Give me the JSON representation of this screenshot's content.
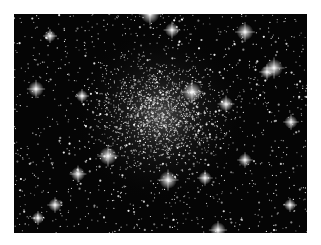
{
  "image": {
    "subject": "globular star cluster",
    "description": "Grayscale astronomical photograph of a dense globular star cluster against a black sky, with a bright dense core slightly above and left of center and scattered foreground stars with diffraction spikes.",
    "background_color": "#050505",
    "page_color": "#ffffff",
    "frame": {
      "x": 14,
      "y": 14,
      "width": 293,
      "height": 219
    },
    "cluster_core": {
      "x": 160,
      "y": 115,
      "radius": 55
    },
    "bright_stars": [
      {
        "x": 150,
        "y": 14,
        "r": 3.2
      },
      {
        "x": 172,
        "y": 30,
        "r": 2.4
      },
      {
        "x": 245,
        "y": 32,
        "r": 2.8
      },
      {
        "x": 50,
        "y": 36,
        "r": 2.0
      },
      {
        "x": 274,
        "y": 68,
        "r": 3.0
      },
      {
        "x": 267,
        "y": 72,
        "r": 2.2
      },
      {
        "x": 36,
        "y": 89,
        "r": 2.6
      },
      {
        "x": 192,
        "y": 92,
        "r": 3.2
      },
      {
        "x": 226,
        "y": 104,
        "r": 2.4
      },
      {
        "x": 82,
        "y": 96,
        "r": 2.0
      },
      {
        "x": 291,
        "y": 122,
        "r": 2.2
      },
      {
        "x": 108,
        "y": 156,
        "r": 3.0
      },
      {
        "x": 245,
        "y": 160,
        "r": 2.2
      },
      {
        "x": 168,
        "y": 180,
        "r": 3.0
      },
      {
        "x": 205,
        "y": 178,
        "r": 2.2
      },
      {
        "x": 78,
        "y": 174,
        "r": 2.4
      },
      {
        "x": 55,
        "y": 205,
        "r": 2.2
      },
      {
        "x": 218,
        "y": 230,
        "r": 2.6
      },
      {
        "x": 38,
        "y": 218,
        "r": 2.0
      },
      {
        "x": 290,
        "y": 205,
        "r": 2.0
      }
    ],
    "star_count": 2600,
    "seed": 7
  }
}
